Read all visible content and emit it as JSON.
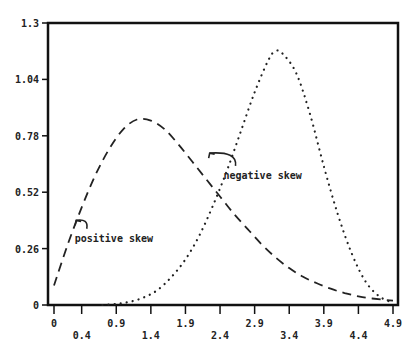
{
  "chart_data": {
    "type": "line",
    "title": "",
    "xlabel": "",
    "ylabel": "",
    "xlim": [
      0,
      4.9
    ],
    "ylim": [
      0,
      1.3
    ],
    "grid": false,
    "legend": null,
    "x_ticks_upper": [
      "0",
      "0.9",
      "1.9",
      "2.9",
      "3.9",
      "4.9"
    ],
    "x_ticks_lower": [
      "0.4",
      "1.4",
      "2.4",
      "3.4",
      "4.4"
    ],
    "x_tick_values_upper": [
      0,
      0.9,
      1.9,
      2.9,
      3.9,
      4.9
    ],
    "x_tick_values_lower": [
      0.4,
      1.4,
      2.4,
      3.4,
      4.4
    ],
    "y_ticks": [
      "0",
      "0.26",
      "0.52",
      "0.78",
      "1.04",
      "1.3"
    ],
    "y_tick_values": [
      0,
      0.26,
      0.52,
      0.78,
      1.04,
      1.3
    ],
    "series": [
      {
        "name": "positive skew",
        "style": "dashed",
        "x": [
          0.0,
          0.2,
          0.4,
          0.6,
          0.8,
          1.0,
          1.2,
          1.4,
          1.6,
          1.8,
          2.0,
          2.2,
          2.4,
          2.6,
          2.8,
          3.0,
          3.2,
          3.4,
          3.6,
          3.8,
          4.0,
          4.2,
          4.4,
          4.6,
          4.9
        ],
        "y": [
          0.09,
          0.28,
          0.45,
          0.6,
          0.72,
          0.81,
          0.855,
          0.85,
          0.81,
          0.74,
          0.66,
          0.58,
          0.5,
          0.42,
          0.35,
          0.28,
          0.22,
          0.17,
          0.13,
          0.1,
          0.075,
          0.055,
          0.04,
          0.03,
          0.02
        ]
      },
      {
        "name": "negative skew",
        "style": "dotted",
        "x": [
          0.7,
          0.9,
          1.1,
          1.3,
          1.5,
          1.7,
          1.9,
          2.1,
          2.3,
          2.5,
          2.7,
          2.9,
          3.1,
          3.2,
          3.3,
          3.5,
          3.7,
          3.9,
          4.1,
          4.3,
          4.5,
          4.7,
          4.9
        ],
        "y": [
          0.0,
          0.005,
          0.015,
          0.035,
          0.07,
          0.13,
          0.21,
          0.32,
          0.46,
          0.62,
          0.8,
          0.98,
          1.13,
          1.17,
          1.16,
          1.07,
          0.88,
          0.64,
          0.42,
          0.24,
          0.11,
          0.04,
          0.01
        ]
      }
    ],
    "annotations": [
      {
        "text": "positive skew",
        "x": 0.3,
        "y": 0.31,
        "arrow_to": [
          0.32,
          0.39
        ]
      },
      {
        "text": "negative skew",
        "x": 2.45,
        "y": 0.6,
        "arrow_to": [
          2.25,
          0.7
        ]
      }
    ]
  }
}
